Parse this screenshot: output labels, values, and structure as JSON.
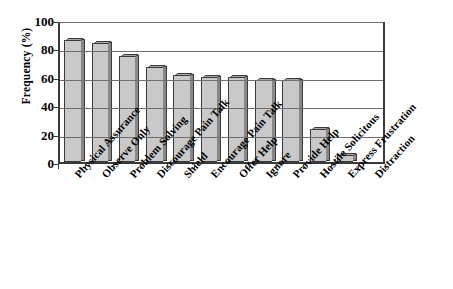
{
  "chart_data": {
    "type": "bar",
    "title": "",
    "xlabel": "",
    "ylabel": "Frequency (%)",
    "ylim": [
      0,
      100
    ],
    "yticks": [
      0,
      20,
      40,
      60,
      80,
      100
    ],
    "grid": true,
    "legend": "none",
    "categories": [
      "Physical Assurance",
      "Observe Only",
      "Problem Solving",
      "Discourage Pain Talk",
      "Shield",
      "Encourage Pain Talk",
      "Offer Help",
      "Ignore",
      "Provide Help",
      "Hostile Solicitous",
      "Express Frustration",
      "Distraction"
    ],
    "values": [
      86,
      84,
      75,
      67,
      61,
      60,
      60,
      58,
      58,
      23,
      5,
      0
    ],
    "style": {
      "bar_face": "#c9c9c9",
      "bar_side": "#888888",
      "bar_top": "#a8a8a8",
      "bar_outline": "#3a3a3a",
      "gridline": "#6e6e6e",
      "axis": "#3a3a3a",
      "background": "#ffffff",
      "text": "#000000"
    }
  }
}
